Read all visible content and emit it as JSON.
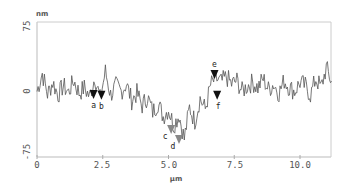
{
  "chart_data": {
    "type": "line",
    "title": "",
    "xlabel": "μm",
    "ylabel": "nm",
    "xlim": [
      0,
      11.2
    ],
    "ylim": [
      -75,
      75
    ],
    "xticks": [
      "0",
      "2.5",
      "5.0",
      "7.5",
      "10.0"
    ],
    "xtick_values": [
      0,
      2.5,
      5.0,
      7.5,
      10.0
    ],
    "yticks": [
      "75",
      "0",
      "-75"
    ],
    "ytick_values": [
      75,
      0,
      -75
    ],
    "grid": false,
    "legend": null,
    "series": [
      {
        "name": "height profile",
        "color": "#555555",
        "x": [
          0.0,
          0.2,
          0.4,
          0.6,
          0.8,
          1.0,
          1.2,
          1.4,
          1.6,
          1.8,
          2.0,
          2.2,
          2.4,
          2.6,
          2.8,
          3.0,
          3.2,
          3.4,
          3.6,
          3.8,
          4.0,
          4.2,
          4.4,
          4.6,
          4.8,
          5.0,
          5.2,
          5.4,
          5.6,
          5.8,
          6.0,
          6.2,
          6.4,
          6.6,
          6.8,
          7.0,
          7.2,
          7.4,
          7.6,
          7.8,
          8.0,
          8.2,
          8.4,
          8.6,
          8.8,
          9.0,
          9.2,
          9.4,
          9.6,
          9.8,
          10.0,
          10.2,
          10.4,
          10.6,
          10.8,
          11.0,
          11.2
        ],
        "values": [
          -2,
          18,
          -5,
          8,
          -6,
          4,
          -3,
          10,
          -4,
          2,
          -8,
          14,
          -10,
          20,
          -6,
          4,
          -2,
          6,
          -12,
          -4,
          -18,
          -8,
          -25,
          -15,
          -30,
          -22,
          -40,
          -28,
          -55,
          -20,
          -35,
          -10,
          -22,
          5,
          12,
          8,
          14,
          6,
          10,
          -2,
          4,
          8,
          2,
          12,
          0,
          6,
          -4,
          10,
          2,
          -2,
          8,
          4,
          -6,
          12,
          2,
          24,
          8
        ]
      }
    ],
    "markers": [
      {
        "label": "a",
        "x": 2.15,
        "y": -6,
        "color": "#111111"
      },
      {
        "label": "b",
        "x": 2.45,
        "y": -7,
        "color": "#111111"
      },
      {
        "label": "c",
        "x": 5.1,
        "y": -45,
        "color": "#888888"
      },
      {
        "label": "d",
        "x": 5.4,
        "y": -56,
        "color": "#888888"
      },
      {
        "label": "e",
        "x": 6.75,
        "y": 16,
        "color": "#111111"
      },
      {
        "label": "f",
        "x": 6.85,
        "y": -7,
        "color": "#111111"
      }
    ]
  },
  "axes": {
    "y_unit": "nm",
    "x_unit": "μm",
    "y_top": "75",
    "y_zero": "0",
    "y_bottom": "-75",
    "x_ticks": [
      "0",
      "2.5",
      "5.0",
      "7.5",
      "10.0"
    ]
  }
}
